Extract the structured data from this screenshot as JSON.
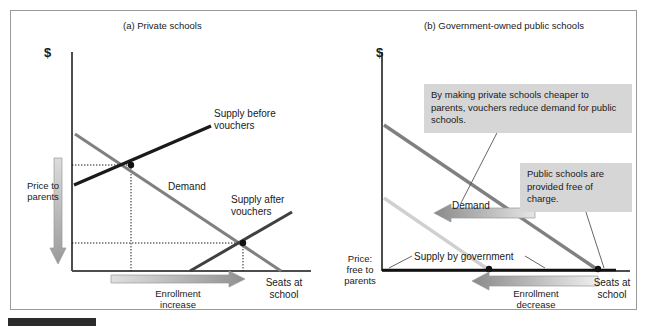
{
  "figure": {
    "panels": [
      {
        "id": "a",
        "title": "(a) Private schools",
        "y_axis_label": "$",
        "x_axis_label": "Seats at\nschool",
        "price_label": "Price to\nparents",
        "curve_labels": {
          "supply_before": "Supply before\nvouchers",
          "supply_after": "Supply after\nvouchers",
          "demand": "Demand"
        },
        "shift_label": "Enrollment\nincrease",
        "shift_direction": "right"
      },
      {
        "id": "b",
        "title": "(b) Government-owned public schools",
        "y_axis_label": "$",
        "x_axis_label": "Seats at\nschool",
        "price_label": "Price:\nfree to\nparents",
        "curve_labels": {
          "demand": "Demand",
          "supply": "Supply by government"
        },
        "shift_label": "Enrollment\ndecrease",
        "shift_direction": "left",
        "callouts": [
          {
            "id": "demand-shift",
            "text": "By making private schools cheaper to parents, vouchers reduce demand for public schools."
          },
          {
            "id": "free-of-charge",
            "text": "Public schools are provided free of charge."
          }
        ]
      }
    ],
    "colors": {
      "supply_dark": "#1a1a1a",
      "supply_after": "#4d4d4d",
      "demand_gray": "#808080",
      "demand_light": "#cfcfcf",
      "callout_bg": "#d6d6d6",
      "frame_border": "#9a9a9a",
      "axis": "#4d4d4d",
      "rule_bar": "#2b2b2b"
    }
  },
  "chart_data": {
    "type": "line",
    "panels": [
      {
        "name": "(a) Private schools",
        "xlabel": "Seats at school",
        "ylabel": "$ (Price to parents)",
        "xlim": [
          0,
          100
        ],
        "ylim": [
          0,
          100
        ],
        "grid": false,
        "series": [
          {
            "name": "Supply before vouchers",
            "style": "solid-black",
            "points": [
              [
                2,
                33
              ],
              [
                62,
                77
              ]
            ]
          },
          {
            "name": "Supply after vouchers",
            "style": "solid-dark-gray",
            "points": [
              [
                40,
                0
              ],
              [
                92,
                40
              ]
            ]
          },
          {
            "name": "Demand",
            "style": "solid-gray",
            "points": [
              [
                2,
                88
              ],
              [
                86,
                0
              ]
            ]
          }
        ],
        "equilibria": [
          {
            "label": "before vouchers",
            "x": 27,
            "y": 52
          },
          {
            "label": "after vouchers",
            "x": 73,
            "y": 17
          }
        ],
        "annotations": [
          {
            "text": "Price to parents",
            "direction": "down",
            "type": "shift-arrow"
          },
          {
            "text": "Enrollment increase",
            "direction": "right",
            "type": "shift-arrow"
          }
        ]
      },
      {
        "name": "(b) Government-owned public schools",
        "xlabel": "Seats at school",
        "ylabel": "$ (Price: free to parents)",
        "xlim": [
          0,
          100
        ],
        "ylim": [
          0,
          100
        ],
        "grid": false,
        "series": [
          {
            "name": "Demand (before vouchers)",
            "style": "solid-gray",
            "points": [
              [
                1,
                72
              ],
              [
                88,
                0
              ]
            ]
          },
          {
            "name": "Demand (after vouchers)",
            "style": "solid-light-gray",
            "points": [
              [
                1,
                36
              ],
              [
                44,
                0
              ]
            ]
          },
          {
            "name": "Supply by government",
            "style": "solid-black-horizontal",
            "points": [
              [
                0,
                0
              ],
              [
                100,
                0
              ]
            ]
          }
        ],
        "equilibria": [
          {
            "label": "after vouchers",
            "x": 44,
            "y": 0
          },
          {
            "label": "before vouchers",
            "x": 88,
            "y": 0
          }
        ],
        "annotations": [
          {
            "text": "Enrollment decrease",
            "direction": "left",
            "type": "shift-arrow"
          },
          {
            "text": "Demand",
            "direction": "left",
            "type": "shift-arrow"
          }
        ]
      }
    ]
  }
}
